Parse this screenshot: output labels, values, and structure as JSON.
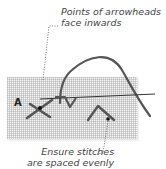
{
  "diagram": {
    "annotations": [
      {
        "id": "top",
        "lines": [
          "Points of arrowheads",
          "face inwards"
        ]
      },
      {
        "id": "bottom",
        "lines": [
          "Ensure stitches",
          "are spaced evenly"
        ]
      }
    ],
    "point_label": "A",
    "colors": {
      "thread": "#555555",
      "fabric": "#f4f4f4",
      "grid": "#969696",
      "text": "#444444",
      "marker": "#111111"
    }
  }
}
